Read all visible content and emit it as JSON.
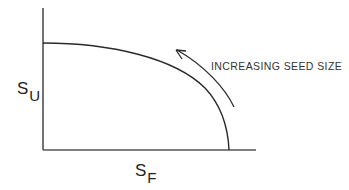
{
  "diagram": {
    "y_axis": {
      "label_main": "S",
      "label_sub": "U"
    },
    "x_axis": {
      "label_main": "S",
      "label_sub": "F"
    },
    "annotation": "INCREASING SEED SIZE",
    "curve": {
      "description": "Concave trade-off curve from high S_U (at S_F = 0) down to S_U = 0 at high S_F"
    },
    "arrow": {
      "direction": "counter-clockwise along curve, toward upper-left",
      "meaning": "increasing seed size"
    },
    "colors": {
      "line": "#2a2a2a",
      "text": "#222222",
      "background": "#ffffff"
    }
  }
}
